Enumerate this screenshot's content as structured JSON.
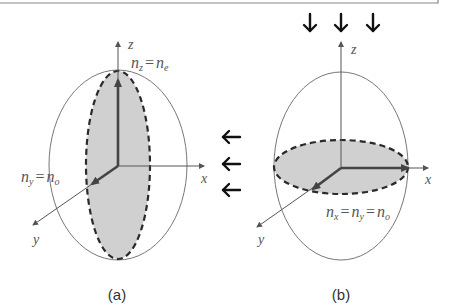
{
  "figure": {
    "panels": [
      {
        "id": "a",
        "caption": "(a)",
        "axes": {
          "x": "x",
          "y": "y",
          "z": "z"
        },
        "label_top": {
          "n": "n",
          "sub1": "z",
          "eq": "=",
          "n2": "n",
          "sub2": "e"
        },
        "label_left": {
          "n": "n",
          "sub1": "y",
          "eq": "=",
          "n2": "n",
          "sub2": "o"
        },
        "incident_light_direction": "from right (along -x)",
        "arrows_count": 3
      },
      {
        "id": "b",
        "caption": "(b)",
        "axes": {
          "x": "x",
          "y": "y",
          "z": "z"
        },
        "label_bottom": {
          "n": "n",
          "sub1": "x",
          "eq1": "=",
          "n2": "n",
          "sub2": "y",
          "eq2": "=",
          "n3": "n",
          "sub3": "o"
        },
        "incident_light_direction": "from top (along -z)",
        "arrows_count": 3
      }
    ],
    "colors": {
      "axis": "#555555",
      "thick_axis": "#444444",
      "outline": "#666666",
      "dashed": "#333333",
      "shade": "#cfcfcf",
      "arrow": "#111111",
      "frame": "#888888"
    }
  }
}
